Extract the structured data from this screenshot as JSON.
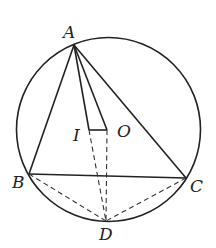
{
  "diagram": {
    "type": "geometry",
    "circle": {
      "center_label": "O",
      "cx": 108.5,
      "cy": 129.5,
      "r": 92
    },
    "points": {
      "A": {
        "label": "A",
        "x": 74,
        "y": 45
      },
      "B": {
        "label": "B",
        "x": 29,
        "y": 174
      },
      "C": {
        "label": "C",
        "x": 186,
        "y": 178
      },
      "D": {
        "label": "D",
        "x": 106,
        "y": 221
      },
      "I": {
        "label": "I",
        "x": 89,
        "y": 130
      },
      "O": {
        "label": "O",
        "x": 107,
        "y": 130
      }
    },
    "labels": {
      "A": "A",
      "B": "B",
      "C": "C",
      "D": "D",
      "I": "I",
      "O": "O"
    },
    "solid_segments": [
      "AB",
      "AC",
      "BC",
      "AI",
      "AO",
      "IO"
    ],
    "dashed_segments": [
      "BD",
      "CD",
      "ID",
      "OD"
    ],
    "colors": {
      "stroke": "#222222",
      "background": "#ffffff"
    }
  }
}
